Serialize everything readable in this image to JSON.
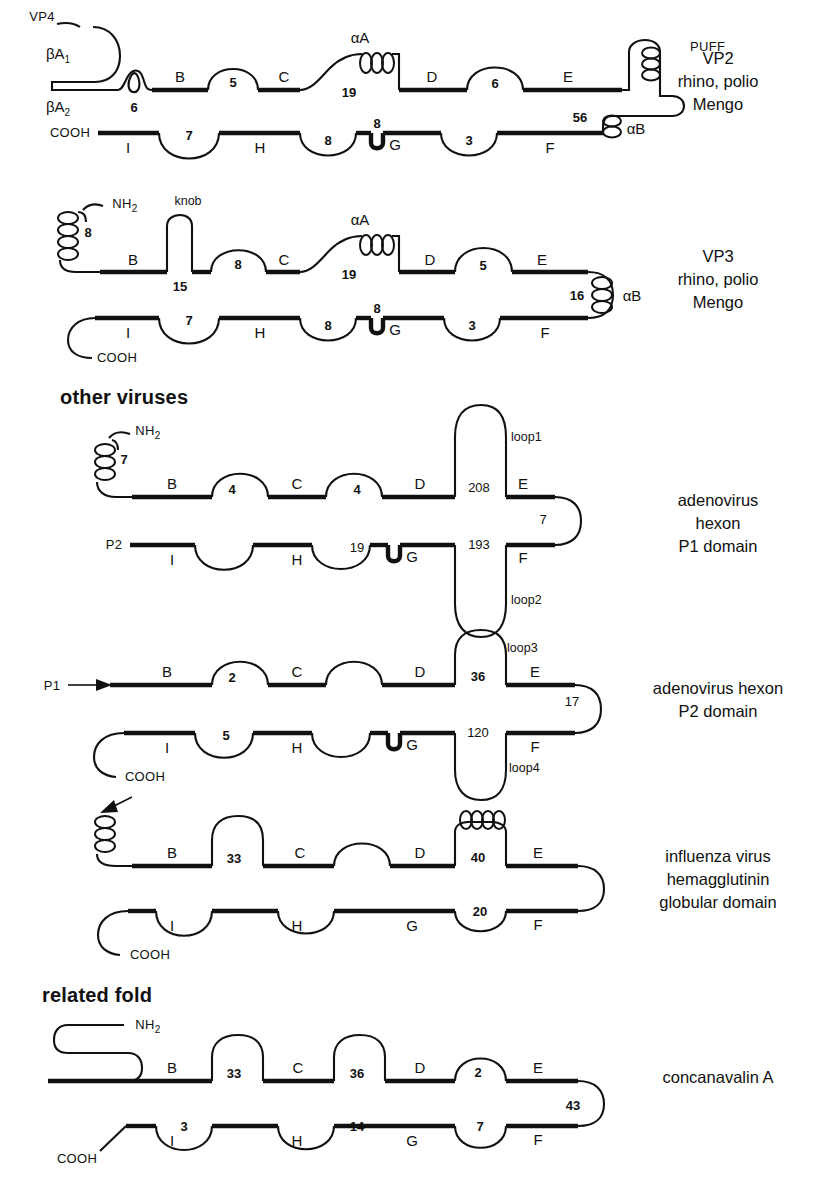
{
  "figure": {
    "title_sections": [
      {
        "id": "other-viruses",
        "label": "other viruses",
        "x": 60,
        "y": 404
      },
      {
        "id": "related-fold",
        "label": "related fold",
        "x": 42,
        "y": 995
      }
    ]
  },
  "captions": [
    {
      "id": "vp2",
      "lines": [
        "VP2",
        "rhino, polio",
        "Mengo"
      ],
      "cx": 718,
      "cy": 64
    },
    {
      "id": "vp3",
      "lines": [
        "VP3",
        "rhino, polio",
        "Mengo"
      ],
      "cx": 718,
      "cy": 262
    },
    {
      "id": "adeno-p1",
      "lines": [
        "adenovirus",
        "hexon",
        "P1 domain"
      ],
      "cx": 718,
      "cy": 506
    },
    {
      "id": "adeno-p2",
      "lines": [
        "adenovirus hexon",
        "P2 domain"
      ],
      "cx": 718,
      "cy": 694
    },
    {
      "id": "influenza",
      "lines": [
        "influenza virus",
        "hemagglutinin",
        "globular domain"
      ],
      "cx": 718,
      "cy": 862
    },
    {
      "id": "concanavalin",
      "lines": [
        "concanavalin A"
      ],
      "cx": 718,
      "cy": 1083
    }
  ],
  "diagrams": [
    {
      "id": "vp2",
      "name": "VP2 rhino polio Mengo",
      "top_strands": [
        "B",
        "C",
        "D",
        "E"
      ],
      "bottom_strands": [
        "I",
        "H",
        "G",
        "F"
      ],
      "top_loop_numbers": [
        "5",
        "19",
        "6"
      ],
      "bottom_loop_numbers": [
        "7",
        "8",
        "8",
        "3"
      ],
      "terminus_labels": [
        "VP4",
        "COOH"
      ],
      "beta_arm_labels": [
        "βA",
        "βA"
      ],
      "beta_arm_subs": [
        "1",
        "2"
      ],
      "helix_labels": [
        "αA",
        "αB",
        "PUFF"
      ],
      "extra_numbers": [
        "6",
        "56"
      ]
    },
    {
      "id": "vp3",
      "name": "VP3 rhino polio Mengo",
      "top_strands": [
        "B",
        "C",
        "D",
        "E"
      ],
      "bottom_strands": [
        "I",
        "H",
        "G",
        "F"
      ],
      "top_loop_numbers": [
        "8",
        "19",
        "5"
      ],
      "bottom_loop_numbers": [
        "7",
        "8",
        "8",
        "3"
      ],
      "terminus_labels": [
        "NH",
        "COOH"
      ],
      "terminus_subs": [
        "2"
      ],
      "helix_labels": [
        "αA",
        "αB"
      ],
      "extra_numbers": [
        "8",
        "15",
        "16"
      ],
      "feature_labels": [
        "knob"
      ]
    },
    {
      "id": "adeno-p1",
      "name": "adenovirus hexon P1 domain",
      "top_strands": [
        "B",
        "C",
        "D",
        "E"
      ],
      "bottom_strands": [
        "I",
        "H",
        "G",
        "F"
      ],
      "top_loop_numbers": [
        "4",
        "4"
      ],
      "bottom_loop_numbers": [
        "19"
      ],
      "terminus_labels": [
        "NH",
        "P2"
      ],
      "terminus_subs": [
        "2"
      ],
      "extra_numbers": [
        "7",
        "208",
        "193",
        "7"
      ],
      "loop_labels": [
        "loop1",
        "loop2"
      ]
    },
    {
      "id": "adeno-p2",
      "name": "adenovirus hexon P2 domain",
      "top_strands": [
        "B",
        "C",
        "D",
        "E"
      ],
      "bottom_strands": [
        "I",
        "H",
        "G",
        "F"
      ],
      "top_loop_numbers": [
        "2"
      ],
      "bottom_loop_numbers": [
        "5"
      ],
      "terminus_labels": [
        "P1",
        "COOH"
      ],
      "extra_numbers": [
        "36",
        "120",
        "17"
      ],
      "loop_labels": [
        "loop3",
        "loop4"
      ]
    },
    {
      "id": "influenza",
      "name": "influenza virus hemagglutinin globular domain",
      "top_strands": [
        "B",
        "C",
        "D",
        "E"
      ],
      "bottom_strands": [
        "I",
        "H",
        "G",
        "F"
      ],
      "top_loop_numbers": [
        "33",
        "40"
      ],
      "bottom_loop_numbers": [
        "20"
      ],
      "terminus_labels": [
        "COOH"
      ],
      "extra_numbers": []
    },
    {
      "id": "concanavalin",
      "name": "concanavalin A",
      "top_strands": [
        "B",
        "C",
        "D",
        "E"
      ],
      "bottom_strands": [
        "I",
        "H",
        "G",
        "F"
      ],
      "top_loop_numbers": [
        "33",
        "36",
        "2"
      ],
      "bottom_loop_numbers": [
        "3",
        "14",
        "7"
      ],
      "terminus_labels": [
        "NH",
        "COOH"
      ],
      "terminus_subs": [
        "2"
      ],
      "extra_numbers": [
        "43"
      ]
    }
  ],
  "labels": {
    "vp2": {
      "vp4": "VP4",
      "bA": "βA",
      "sub1": "1",
      "sub2": "2",
      "n6": "6",
      "B": "B",
      "n5": "5",
      "C": "C",
      "aA": "αA",
      "n19": "19",
      "D": "D",
      "n6b": "6",
      "E": "E",
      "puff": "PUFF",
      "n56": "56",
      "aB": "αB",
      "cooh": "COOH",
      "I": "I",
      "n7": "7",
      "H": "H",
      "n8a": "8",
      "n8b": "8",
      "G": "G",
      "n3": "3",
      "F": "F"
    },
    "vp3": {
      "nh2": "NH",
      "nh2sub": "2",
      "n8helix": "8",
      "knob": "knob",
      "n15": "15",
      "B": "B",
      "n8": "8",
      "C": "C",
      "aA": "αA",
      "n19": "19",
      "D": "D",
      "n5": "5",
      "E": "E",
      "n16": "16",
      "aB": "αB",
      "cooh": "COOH",
      "I": "I",
      "n7": "7",
      "H": "H",
      "n8a": "8",
      "n8b": "8",
      "G": "G",
      "n3": "3",
      "F": "F"
    },
    "adeno_p1": {
      "nh2": "NH",
      "nh2sub": "2",
      "n7helix": "7",
      "B": "B",
      "n4a": "4",
      "C": "C",
      "n4b": "4",
      "D": "D",
      "n208": "208",
      "E": "E",
      "loop1": "loop1",
      "n7": "7",
      "p2": "P2",
      "I": "I",
      "H": "H",
      "n19": "19",
      "G": "G",
      "n193": "193",
      "F": "F",
      "loop2": "loop2"
    },
    "adeno_p2": {
      "p1": "P1",
      "B": "B",
      "n2": "2",
      "C": "C",
      "D": "D",
      "n36": "36",
      "E": "E",
      "loop3": "loop3",
      "n17": "17",
      "cooh": "COOH",
      "I": "I",
      "n5": "5",
      "H": "H",
      "G": "G",
      "n120": "120",
      "F": "F",
      "loop4": "loop4"
    },
    "influenza": {
      "B": "B",
      "n33": "33",
      "C": "C",
      "D": "D",
      "n40": "40",
      "E": "E",
      "cooh": "COOH",
      "I": "I",
      "H": "H",
      "G": "G",
      "n20": "20",
      "F": "F"
    },
    "concanavalin": {
      "nh2": "NH",
      "nh2sub": "2",
      "B": "B",
      "n33": "33",
      "C": "C",
      "n36": "36",
      "D": "D",
      "n2": "2",
      "E": "E",
      "n43": "43",
      "cooh": "COOH",
      "I": "I",
      "n3": "3",
      "H": "H",
      "n14": "14",
      "G": "G",
      "n7": "7",
      "F": "F"
    }
  },
  "colors": {
    "ink": "#111111",
    "background": "#ffffff"
  }
}
